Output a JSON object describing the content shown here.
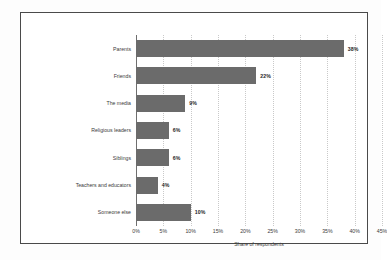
{
  "chart_data": {
    "type": "bar",
    "orientation": "horizontal",
    "title": "",
    "xlabel": "Share of respondents",
    "ylabel": "",
    "categories": [
      "Parents",
      "Friends",
      "The media",
      "Religious leaders",
      "Siblings",
      "Teachers and educators",
      "Someone else"
    ],
    "values": [
      38,
      22,
      9,
      6,
      6,
      4,
      10
    ],
    "value_labels": [
      "38%",
      "22%",
      "9%",
      "6%",
      "6%",
      "4%",
      "10%"
    ],
    "xlim": [
      0,
      45
    ],
    "xticks": [
      0,
      5,
      10,
      15,
      20,
      25,
      30,
      35,
      40,
      45
    ],
    "xtick_labels": [
      "0%",
      "5%",
      "10%",
      "15%",
      "20%",
      "25%",
      "30%",
      "35%",
      "40%",
      "45%"
    ],
    "grid": true,
    "grid_axis": "x",
    "legend": false,
    "bar_color": "#6b6b6b",
    "gridline_color": "#c9c9c9",
    "axis_color": "#6f6f6f",
    "frame_color": "#4a4a4a",
    "background_color": "#ffffff"
  }
}
